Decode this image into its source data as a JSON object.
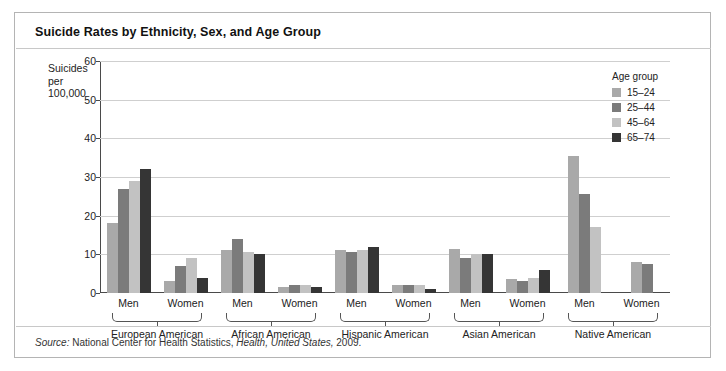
{
  "title": "Suicide Rates by Ethnicity, Sex, and Age Group",
  "y_axis_label_lines": [
    "Suicides",
    "per",
    "100,000"
  ],
  "legend": {
    "title": "Age group",
    "items": [
      {
        "label": "15–24",
        "color": "#a9a9a9"
      },
      {
        "label": "25–44",
        "color": "#7b7b7b"
      },
      {
        "label": "45–64",
        "color": "#c2c2c2"
      },
      {
        "label": "65–74",
        "color": "#353535"
      }
    ]
  },
  "source": {
    "prefix": "Source:",
    "agency": "National Center for Health Statistics,",
    "publication": "Health, United States,",
    "year": "2009."
  },
  "chart_data": {
    "type": "bar",
    "title": "Suicide Rates by Ethnicity, Sex, and Age Group",
    "xlabel": "",
    "ylabel": "Suicides per 100,000",
    "ylim": [
      0,
      60
    ],
    "yticks": [
      0,
      10,
      20,
      30,
      40,
      50,
      60
    ],
    "grid": true,
    "legend_position": "right",
    "series": [
      {
        "name": "15–24",
        "color": "#a9a9a9"
      },
      {
        "name": "25–44",
        "color": "#7b7b7b"
      },
      {
        "name": "45–64",
        "color": "#c2c2c2"
      },
      {
        "name": "65–74",
        "color": "#353535"
      }
    ],
    "groups": [
      {
        "ethnicity": "European American",
        "sexes": [
          {
            "sex": "Men",
            "values": [
              18,
              27,
              29,
              32
            ]
          },
          {
            "sex": "Women",
            "values": [
              3,
              7,
              9,
              4
            ]
          }
        ]
      },
      {
        "ethnicity": "African American",
        "sexes": [
          {
            "sex": "Men",
            "values": [
              11,
              14,
              10.5,
              10
            ]
          },
          {
            "sex": "Women",
            "values": [
              1.5,
              2,
              2,
              1.5
            ]
          }
        ]
      },
      {
        "ethnicity": "Hispanic American",
        "sexes": [
          {
            "sex": "Men",
            "values": [
              11,
              10.5,
              11,
              12
            ]
          },
          {
            "sex": "Women",
            "values": [
              2,
              2,
              2,
              1
            ]
          }
        ]
      },
      {
        "ethnicity": "Asian American",
        "sexes": [
          {
            "sex": "Men",
            "values": [
              11.5,
              9,
              10,
              10
            ]
          },
          {
            "sex": "Women",
            "values": [
              3.5,
              3,
              4,
              6
            ]
          }
        ]
      },
      {
        "ethnicity": "Native American",
        "sexes": [
          {
            "sex": "Men",
            "values": [
              35.5,
              25.5,
              17,
              null
            ]
          },
          {
            "sex": "Women",
            "values": [
              8,
              7.5,
              null,
              null
            ]
          }
        ]
      }
    ]
  }
}
